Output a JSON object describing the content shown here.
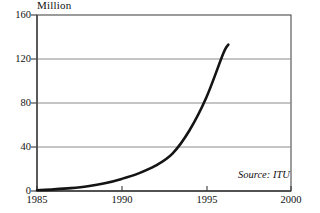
{
  "chart_data": {
    "type": "line",
    "title": "",
    "ylabel": "Million",
    "xlabel": "",
    "ylim": [
      0,
      160
    ],
    "xlim": [
      1985,
      2000
    ],
    "grid": true,
    "legend": "none",
    "annotation": "Source: ITU",
    "y_ticks": [
      0,
      40,
      80,
      120,
      160
    ],
    "y_tick_labels": [
      "0",
      "40",
      "80",
      "120",
      "160"
    ],
    "x_ticks": [
      1985,
      1990,
      1995,
      2000
    ],
    "x_tick_labels": [
      "1985",
      "1990",
      "1995",
      "2000"
    ],
    "series": [
      {
        "name": "Mobile subscribers",
        "x": [
          1985,
          1986,
          1987,
          1988,
          1989,
          1990,
          1991,
          1992,
          1993,
          1994,
          1995,
          1996,
          1996.3
        ],
        "values": [
          0.7,
          1.5,
          2.6,
          4.3,
          7.0,
          11.0,
          16.0,
          23.0,
          34.0,
          55.0,
          85.0,
          125.0,
          133.0
        ]
      }
    ],
    "colors": {
      "line": "#141414",
      "grid": "#8a8a8a",
      "axis": "#555555",
      "background": "#ffffff"
    }
  },
  "labels": {
    "y_axis_title": "Million",
    "source": "Source: ITU",
    "y0": "0",
    "y1": "40",
    "y2": "80",
    "y3": "120",
    "y4": "160",
    "x0": "1985",
    "x1": "1990",
    "x2": "1995",
    "x3": "2000"
  }
}
